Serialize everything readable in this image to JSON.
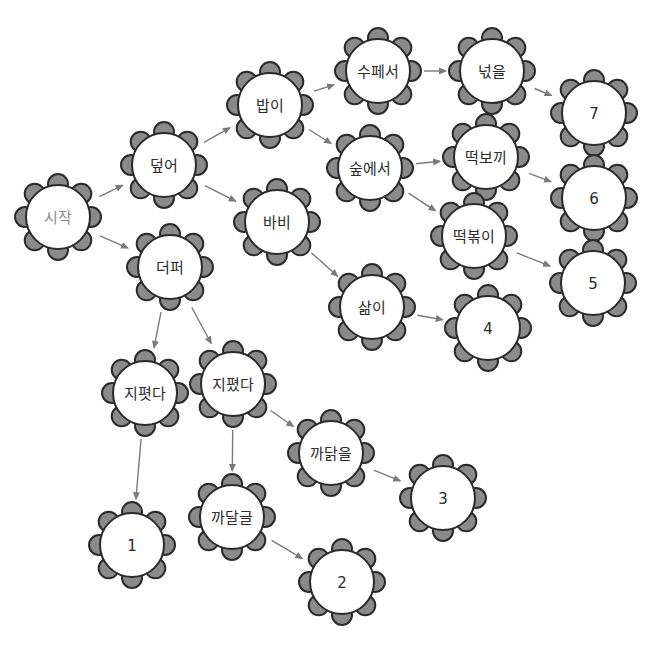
{
  "diagram": {
    "type": "decision-tree",
    "style": {
      "petal_fill": "#8a8a8a",
      "outline": "#2a2a2a",
      "core_fill": "#ffffff",
      "edge_color": "#7a7a7a",
      "text_color": "#2b2b2b",
      "start_text_color": "#8c8c8c"
    },
    "nodes": [
      {
        "id": "start",
        "label": "시작",
        "x": 58,
        "y": 217,
        "muted": true
      },
      {
        "id": "deopeo",
        "label": "덮어",
        "x": 164,
        "y": 165
      },
      {
        "id": "deopeo2",
        "label": "더퍼",
        "x": 170,
        "y": 267
      },
      {
        "id": "babi1",
        "label": "밥이",
        "x": 270,
        "y": 105
      },
      {
        "id": "babi2",
        "label": "바비",
        "x": 277,
        "y": 222
      },
      {
        "id": "supeseo",
        "label": "수페서",
        "x": 378,
        "y": 71
      },
      {
        "id": "supeseo2",
        "label": "숲에서",
        "x": 370,
        "y": 168
      },
      {
        "id": "salmi",
        "label": "삶이",
        "x": 372,
        "y": 307
      },
      {
        "id": "neoks",
        "label": "넋을",
        "x": 492,
        "y": 71
      },
      {
        "id": "ttbokki1",
        "label": "떡보끼",
        "x": 486,
        "y": 157
      },
      {
        "id": "ttbokki2",
        "label": "떡볶이",
        "x": 474,
        "y": 236
      },
      {
        "id": "n7",
        "label": "7",
        "x": 594,
        "y": 113
      },
      {
        "id": "n6",
        "label": "6",
        "x": 594,
        "y": 198
      },
      {
        "id": "n5",
        "label": "5",
        "x": 593,
        "y": 283
      },
      {
        "id": "n4",
        "label": "4",
        "x": 488,
        "y": 328
      },
      {
        "id": "jipyeot",
        "label": "지폇다",
        "x": 145,
        "y": 393
      },
      {
        "id": "jipyeot2",
        "label": "지폈다",
        "x": 233,
        "y": 384
      },
      {
        "id": "kkadal",
        "label": "까닭을",
        "x": 331,
        "y": 453
      },
      {
        "id": "kkadal2",
        "label": "까달글",
        "x": 232,
        "y": 517
      },
      {
        "id": "n1",
        "label": "1",
        "x": 132,
        "y": 545
      },
      {
        "id": "n2",
        "label": "2",
        "x": 342,
        "y": 582
      },
      {
        "id": "n3",
        "label": "3",
        "x": 443,
        "y": 498
      }
    ],
    "edges": [
      {
        "from": "start",
        "to": "deopeo"
      },
      {
        "from": "start",
        "to": "deopeo2"
      },
      {
        "from": "deopeo",
        "to": "babi1"
      },
      {
        "from": "deopeo",
        "to": "babi2"
      },
      {
        "from": "babi1",
        "to": "supeseo"
      },
      {
        "from": "babi1",
        "to": "supeseo2"
      },
      {
        "from": "supeseo",
        "to": "neoks"
      },
      {
        "from": "neoks",
        "to": "n7"
      },
      {
        "from": "supeseo2",
        "to": "ttbokki1"
      },
      {
        "from": "supeseo2",
        "to": "ttbokki2"
      },
      {
        "from": "ttbokki1",
        "to": "n6"
      },
      {
        "from": "ttbokki2",
        "to": "n5"
      },
      {
        "from": "babi2",
        "to": "salmi"
      },
      {
        "from": "salmi",
        "to": "n4"
      },
      {
        "from": "deopeo2",
        "to": "jipyeot"
      },
      {
        "from": "deopeo2",
        "to": "jipyeot2"
      },
      {
        "from": "jipyeot",
        "to": "n1"
      },
      {
        "from": "jipyeot2",
        "to": "kkadal2"
      },
      {
        "from": "jipyeot2",
        "to": "kkadal"
      },
      {
        "from": "kkadal2",
        "to": "n2"
      },
      {
        "from": "kkadal",
        "to": "n3"
      }
    ]
  }
}
